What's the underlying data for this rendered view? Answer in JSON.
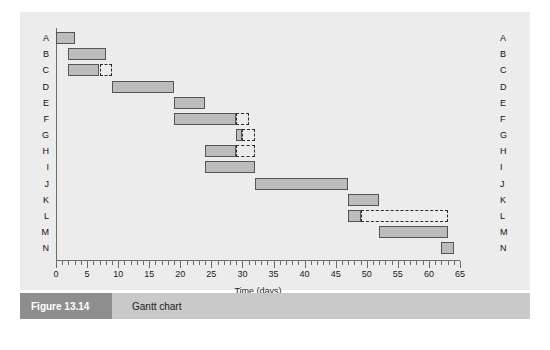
{
  "figure": {
    "number": "Figure 13.14",
    "caption": "Gantt chart"
  },
  "chart_data": {
    "type": "bar",
    "chart_subtype": "gantt",
    "title": "Gantt chart",
    "xlabel": "Time (days)",
    "ylabel": "",
    "xlim": [
      0,
      65
    ],
    "ylim": [
      0,
      14
    ],
    "grid": false,
    "legend": null,
    "x_major_ticks": [
      0,
      5,
      10,
      15,
      20,
      25,
      30,
      35,
      40,
      45,
      50,
      55,
      60,
      65
    ],
    "x_tick_labels": [
      "0",
      "5",
      "10",
      "15",
      "20",
      "25",
      "30",
      "35",
      "40",
      "45",
      "50",
      "55",
      "60",
      "65"
    ],
    "x_minor_tick_interval": 1,
    "categories": [
      "A",
      "B",
      "C",
      "D",
      "E",
      "F",
      "G",
      "H",
      "I",
      "J",
      "K",
      "L",
      "M",
      "N"
    ],
    "bar_fill_color": "#bcbcbc",
    "bar_edge_color": "#555555",
    "float_style": "dashed",
    "tasks": [
      {
        "label": "A",
        "start": 0,
        "end": 3,
        "duration": 3,
        "float_end": 3,
        "float": 0
      },
      {
        "label": "B",
        "start": 2,
        "end": 8,
        "duration": 6,
        "float_end": 8,
        "float": 0
      },
      {
        "label": "C",
        "start": 2,
        "end": 7,
        "duration": 5,
        "float_end": 9,
        "float": 2
      },
      {
        "label": "D",
        "start": 9,
        "end": 19,
        "duration": 10,
        "float_end": 19,
        "float": 0
      },
      {
        "label": "E",
        "start": 19,
        "end": 24,
        "duration": 5,
        "float_end": 24,
        "float": 0
      },
      {
        "label": "F",
        "start": 19,
        "end": 29,
        "duration": 10,
        "float_end": 31,
        "float": 2
      },
      {
        "label": "G",
        "start": 29,
        "end": 30,
        "duration": 1,
        "float_end": 32,
        "float": 2
      },
      {
        "label": "H",
        "start": 24,
        "end": 29,
        "duration": 5,
        "float_end": 32,
        "float": 3
      },
      {
        "label": "I",
        "start": 24,
        "end": 32,
        "duration": 8,
        "float_end": 32,
        "float": 0
      },
      {
        "label": "J",
        "start": 32,
        "end": 47,
        "duration": 15,
        "float_end": 47,
        "float": 0
      },
      {
        "label": "K",
        "start": 47,
        "end": 52,
        "duration": 5,
        "float_end": 52,
        "float": 0
      },
      {
        "label": "L",
        "start": 47,
        "end": 49,
        "duration": 2,
        "float_end": 63,
        "float": 14
      },
      {
        "label": "M",
        "start": 52,
        "end": 63,
        "duration": 11,
        "float_end": 63,
        "float": 0
      },
      {
        "label": "N",
        "start": 62,
        "end": 64,
        "duration": 2,
        "float_end": 64,
        "float": 0
      }
    ]
  }
}
